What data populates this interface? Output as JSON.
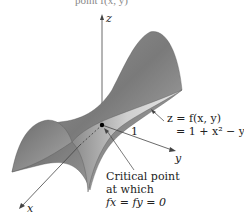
{
  "figure": {
    "top_cropped_text": "point f(x, y)",
    "axes": {
      "z_label": "z",
      "y_label": "y",
      "x_label": "x"
    },
    "tick_label": "1",
    "function_label": {
      "line1": "z = f(x, y)",
      "line2": "= 1 + x² − y²"
    },
    "critical_point_label": {
      "line1": "Critical point",
      "line2": "at which",
      "line3": "fx = fy = 0"
    },
    "colors": {
      "surface_dark": "#6e6e6e",
      "surface_light": "#d0d0d0",
      "axis": "#444444",
      "text": "#222222"
    }
  }
}
